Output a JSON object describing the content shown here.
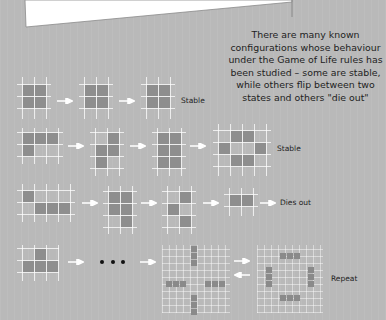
{
  "caption": {
    "lines": [
      "There are many known",
      "configurations whose behaviour",
      "under the Game of Life rules has",
      "been studied – some are stable,",
      "while others flip between two",
      "states and others \"die out\""
    ]
  },
  "rows": [
    {
      "label": "Stable"
    },
    {
      "label": "Stable"
    },
    {
      "label": "Dies out"
    },
    {
      "label": "Repeat"
    }
  ],
  "colors": {
    "background": "#b9b9b9",
    "cell": "#8e8e8e",
    "grid_line": "#ffffff",
    "text": "#1e1e1e"
  },
  "icons": {
    "arrow": "right-arrow-icon",
    "ellipsis": "ellipsis-dots"
  }
}
